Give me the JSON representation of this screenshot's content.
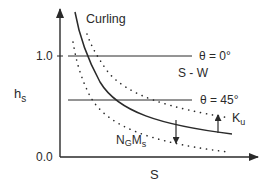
{
  "diagram": {
    "y_axis_label": "h",
    "y_axis_label_sub": "s",
    "x_axis_label": "S",
    "y_ticks": [
      {
        "label": "1.0",
        "value": 1.0
      },
      {
        "label": "0.0",
        "value": 0.0
      }
    ],
    "curves": {
      "solid_label": "Curling",
      "upper_dotted_label": "K",
      "upper_dotted_label_sub": "u",
      "lower_dotted_label_n": "N",
      "lower_dotted_label_n_sub": "G",
      "lower_dotted_label_m": "M",
      "lower_dotted_label_m_sub": "s"
    },
    "reference_lines": [
      {
        "label": "θ = 0°",
        "value": 1.0
      },
      {
        "label": "θ = 45°"
      }
    ],
    "region_label": "S - W",
    "colors": {
      "ink": "#2a2a2a",
      "background": "#ffffff"
    }
  }
}
